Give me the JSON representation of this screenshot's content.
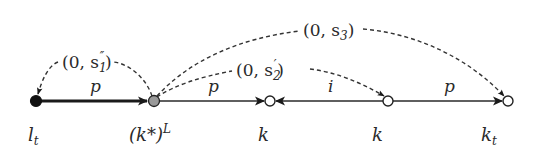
{
  "diagram": {
    "nodes": [
      {
        "id": "lt",
        "label_base": "l",
        "label_sub": "t",
        "x": 36,
        "fill": "#111111"
      },
      {
        "id": "kstarL",
        "label": "(k*)",
        "label_sup": "L",
        "x": 154,
        "fill": "#999999"
      },
      {
        "id": "k1",
        "label": "k",
        "x": 270,
        "fill": "#ffffff"
      },
      {
        "id": "k2",
        "label": "k",
        "x": 388,
        "fill": "#ffffff"
      },
      {
        "id": "kt",
        "label_base": "k",
        "label_sub": "t",
        "x": 508,
        "fill": "#ffffff"
      }
    ],
    "edges": [
      {
        "from": "lt",
        "to": "kstarL",
        "label": "p",
        "style": "solid-bold"
      },
      {
        "from": "kstarL",
        "to": "k1",
        "label": "p",
        "style": "solid"
      },
      {
        "from": "k2",
        "to": "k1",
        "label": "i",
        "style": "solid"
      },
      {
        "from": "k2",
        "to": "kt",
        "label": "p",
        "style": "solid"
      }
    ],
    "dashed_edges": [
      {
        "from": "kstarL",
        "to": "lt",
        "label_open": "(0, s",
        "label_sub": "1",
        "label_prime": "″",
        "label_close": ")"
      },
      {
        "from": "kstarL",
        "to": "k2",
        "label_open": "(0, s",
        "label_sub": "2",
        "label_prime": "′",
        "label_close": ")"
      },
      {
        "from": "kstarL",
        "to": "kt",
        "label_open": "(0, s",
        "label_sub": "3",
        "label_prime": "",
        "label_close": ")"
      }
    ],
    "colors": {
      "stroke": "#2a2a2a",
      "dash": "#333333"
    }
  }
}
